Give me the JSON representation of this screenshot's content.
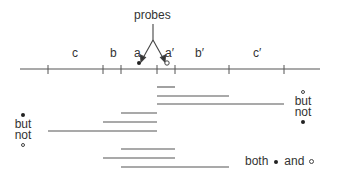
{
  "diagram": {
    "probes_label": "probes",
    "segment_labels": {
      "c": "c",
      "b": "b",
      "a": "a",
      "a_prime": "a′",
      "b_prime": "b′",
      "c_prime": "c′"
    },
    "axis": {
      "y": 69,
      "x_start": 20,
      "x_end": 320,
      "ticks": [
        48,
        103,
        121,
        157,
        175,
        229,
        284
      ]
    },
    "bar_groups": [
      {
        "name": "open-but-not-filled",
        "bars": [
          {
            "y": 87,
            "x1": 157,
            "x2": 175
          },
          {
            "y": 96,
            "x1": 157,
            "x2": 229
          },
          {
            "y": 104,
            "x1": 157,
            "x2": 284
          }
        ]
      },
      {
        "name": "filled-but-not-open",
        "bars": [
          {
            "y": 113,
            "x1": 121,
            "x2": 157
          },
          {
            "y": 122,
            "x1": 103,
            "x2": 157
          },
          {
            "y": 131,
            "x1": 48,
            "x2": 157
          }
        ]
      },
      {
        "name": "both",
        "bars": [
          {
            "y": 149,
            "x1": 121,
            "x2": 175
          },
          {
            "y": 158,
            "x1": 103,
            "x2": 175
          },
          {
            "y": 167,
            "x1": 121,
            "x2": 229
          }
        ]
      }
    ],
    "left_annotation": {
      "word1": "but",
      "word2": "not"
    },
    "right_annotation": {
      "word1": "but",
      "word2": "not"
    },
    "legend": {
      "both": "both",
      "and": "and"
    }
  }
}
